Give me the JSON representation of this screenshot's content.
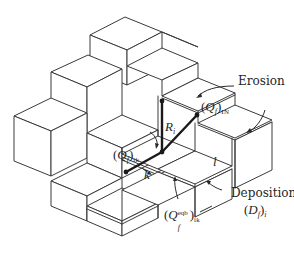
{
  "diagram": {
    "type": "isometric-block-diagram",
    "labels": {
      "erosion": "Erosion",
      "deposition": "Deposition",
      "deposition_symbol_open": "(",
      "deposition_symbol_var": "D",
      "deposition_symbol_sub_f": "f",
      "deposition_symbol_close": ")",
      "deposition_symbol_sub_i": "i",
      "q_in_open": "(",
      "q_in_var": "Q",
      "q_in_sub_f": "f",
      "q_in_close": ")",
      "q_in_sub": "IN",
      "r_var": "R",
      "r_sub": "i",
      "q_ik_open": "(",
      "q_ik_var": "Q",
      "q_ik_sub_f": "f",
      "q_ik_close": ")",
      "q_ik_sub": "ik",
      "k": "k",
      "l": "l",
      "q_eqb_open": "(",
      "q_eqb_var": "Q",
      "q_eqb_sub_f": "f",
      "q_eqb_sup": "eqb",
      "q_eqb_close": ")",
      "q_eqb_sub": "ik"
    },
    "colors": {
      "line": "#3a3a3a",
      "vector": "#1a1a1a",
      "background": "#ffffff"
    }
  }
}
